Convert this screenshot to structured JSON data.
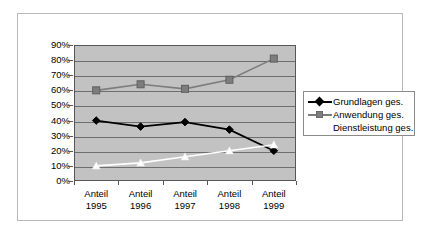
{
  "chart_data": {
    "type": "line",
    "title": "",
    "subtitle": "",
    "xlabel": "",
    "ylabel": "",
    "categories": [
      "Anteil 1995",
      "Anteil 1996",
      "Anteil 1997",
      "Anteil 1998",
      "Anteil 1999"
    ],
    "category_lines": [
      {
        "l1": "Anteil",
        "l2": "1995"
      },
      {
        "l1": "Anteil",
        "l2": "1996"
      },
      {
        "l1": "Anteil",
        "l2": "1997"
      },
      {
        "l1": "Anteil",
        "l2": "1998"
      },
      {
        "l1": "Anteil",
        "l2": "1999"
      }
    ],
    "series": [
      {
        "name": "Grundlagen ges.",
        "color": "#000000",
        "marker": "diamond",
        "values": [
          40,
          36,
          39,
          34,
          20
        ]
      },
      {
        "name": "Anwendung ges.",
        "color": "#7d7d7d",
        "marker": "square",
        "values": [
          60,
          64,
          61,
          67,
          81
        ]
      },
      {
        "name": "Dienstleistung ges.",
        "color": "#ffffff",
        "marker": "triangle",
        "values": [
          10,
          12,
          16,
          20,
          24
        ]
      }
    ],
    "ylim": [
      0,
      90
    ],
    "ytick_step": 10,
    "ytick_labels": [
      "90%",
      "80%",
      "70%",
      "60%",
      "50%",
      "40%",
      "30%",
      "20%",
      "10%",
      "0%"
    ],
    "grid": true,
    "legend_position": "right",
    "plot_background": "#c2c2c2",
    "figure_background": "#ffffff"
  },
  "legend": {
    "entries": [
      {
        "label": "Grundlagen ges."
      },
      {
        "label": "Anwendung ges."
      },
      {
        "label": "Dienstleistung ges."
      }
    ]
  }
}
